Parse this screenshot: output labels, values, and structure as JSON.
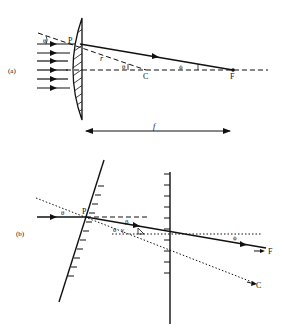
{
  "figure": {
    "panel_a": {
      "label": "(a)",
      "point_P": "P",
      "point_C": "C",
      "point_F": "F",
      "radius_label": "r",
      "angle_theta": "θ",
      "angle_theta_c": "θ",
      "angle_phi": "ϕ",
      "focal_label": "f"
    },
    "panel_b": {
      "label": "(b)",
      "point_P": "P",
      "point_F": "F",
      "point_C": "C",
      "angle_theta": "θ",
      "angle_beta": "β",
      "angle_theta2": "θ",
      "angle_gamma": "γ",
      "angle_phi": "ϕ"
    },
    "colors": {
      "ink": "#111111",
      "background": "#ffffff"
    }
  }
}
